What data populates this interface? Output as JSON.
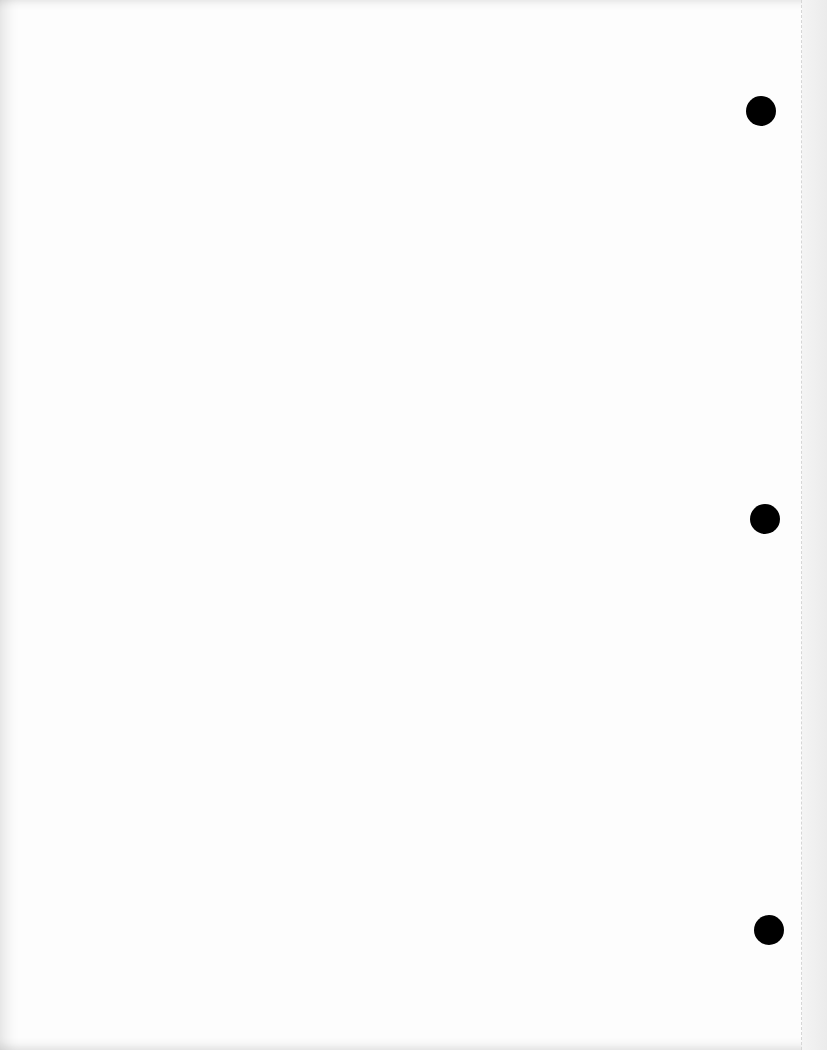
{
  "document": {
    "type": "blank hole-punched sheet",
    "text": "",
    "background_color": "#fdfdfd",
    "hole_color": "#000000",
    "punch_holes": [
      {
        "id": "top",
        "cx": 761,
        "cy": 111,
        "r": 15
      },
      {
        "id": "middle",
        "cx": 765,
        "cy": 519,
        "r": 15
      },
      {
        "id": "bottom",
        "cx": 769,
        "cy": 930,
        "r": 15
      }
    ],
    "perforation_x": 801
  }
}
